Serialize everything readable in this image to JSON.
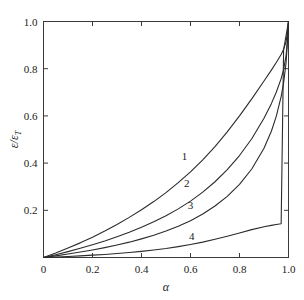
{
  "figure": {
    "background_color": "#ffffff",
    "frame_color": "#3a3a3a",
    "curve_color": "#2b2b2b"
  },
  "axes": {
    "x_title": "α",
    "y_title": "ε/ε",
    "y_title_subscript": "T",
    "x_ticks": [
      "0",
      "0.2",
      "0.4",
      "0.6",
      "0.8",
      "1.0"
    ],
    "x_tick_values": [
      0,
      0.2,
      0.4,
      0.6,
      0.8,
      1.0
    ],
    "y_ticks": [
      "0.2",
      "0.4",
      "0.6",
      "0.8",
      "1.0"
    ],
    "y_tick_values": [
      0.2,
      0.4,
      0.6,
      0.8,
      1.0
    ],
    "x_origin_label": "0"
  },
  "curve_labels": [
    {
      "text": "1",
      "x": 0.575,
      "y": 0.415
    },
    {
      "text": "2",
      "x": 0.585,
      "y": 0.3
    },
    {
      "text": "3",
      "x": 0.6,
      "y": 0.205
    },
    {
      "text": "4",
      "x": 0.605,
      "y": 0.075
    }
  ],
  "chart_data": {
    "type": "line",
    "title": "",
    "xlabel": "α",
    "ylabel": "ε/ε_T",
    "xlim": [
      0,
      1
    ],
    "ylim": [
      0,
      1
    ],
    "grid": false,
    "legend_position": "inline-curve-labels",
    "x": [
      0,
      0.05,
      0.1,
      0.15,
      0.2,
      0.25,
      0.3,
      0.35,
      0.4,
      0.45,
      0.5,
      0.55,
      0.6,
      0.65,
      0.7,
      0.75,
      0.8,
      0.85,
      0.9,
      0.93,
      0.95,
      0.97,
      0.98,
      0.99,
      0.995,
      1.0
    ],
    "series": [
      {
        "name": "1",
        "values": [
          0,
          0.019,
          0.04,
          0.062,
          0.086,
          0.112,
          0.14,
          0.17,
          0.202,
          0.237,
          0.275,
          0.317,
          0.363,
          0.414,
          0.47,
          0.532,
          0.6,
          0.672,
          0.748,
          0.794,
          0.826,
          0.86,
          0.882,
          0.915,
          0.948,
          1.0
        ]
      },
      {
        "name": "2",
        "values": [
          0,
          0.012,
          0.025,
          0.039,
          0.054,
          0.07,
          0.088,
          0.107,
          0.128,
          0.151,
          0.177,
          0.206,
          0.239,
          0.277,
          0.321,
          0.372,
          0.432,
          0.503,
          0.59,
          0.652,
          0.7,
          0.758,
          0.796,
          0.855,
          0.915,
          1.0
        ]
      },
      {
        "name": "3",
        "values": [
          0,
          0.007,
          0.015,
          0.023,
          0.032,
          0.042,
          0.053,
          0.065,
          0.079,
          0.094,
          0.112,
          0.132,
          0.156,
          0.184,
          0.218,
          0.259,
          0.31,
          0.375,
          0.463,
          0.535,
          0.598,
          0.682,
          0.74,
          0.824,
          0.9,
          1.0
        ]
      },
      {
        "name": "4",
        "values": [
          0,
          0.002,
          0.004,
          0.007,
          0.01,
          0.013,
          0.017,
          0.021,
          0.026,
          0.032,
          0.038,
          0.046,
          0.055,
          0.065,
          0.077,
          0.09,
          0.104,
          0.118,
          0.13,
          0.136,
          0.14,
          0.143,
          0.88,
          0.94,
          0.97,
          1.0
        ]
      }
    ]
  }
}
